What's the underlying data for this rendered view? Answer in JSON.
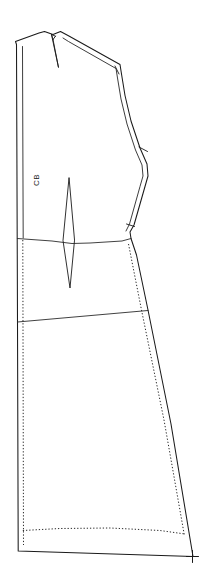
{
  "drawing": {
    "title": "Back bodice and skirt pattern piece",
    "type": "sewing-pattern-technical-drawing",
    "canvas": {
      "width": 204,
      "height": 585,
      "background": "#ffffff"
    },
    "colors": {
      "cutting_line": "#1a1a1a",
      "seam_line": "#1a1a1a",
      "stitch_line": "#2b2b2b",
      "background": "#ffffff"
    }
  },
  "labels": {
    "center_back": "CB",
    "center_back_position": {
      "x": 32,
      "y": 186
    }
  },
  "pattern": {
    "piece_name": "CB",
    "cutting_line_path": "M 15.5 41.5 L 16.5 44.5 L 17.2 238.0 L 17.5 322.0 L 18.2 551.0 L 193.0 556.5 L 171.0 424.0 L 148.0 310.0 L 136.5 255.0 L 131.0 238.5 L 130.0 232.0 L 134.0 225.0 L 145.0 186.5 L 148.0 176.0 L 147.0 164.0 L 140.0 148.0 L 131.0 121.0 L 125.0 95.5 L 121.5 74.0 L 120.0 64.5 L 68.0 35.5 L 60.5 31.5 L 53.0 34.5 L 44.5 31.5 L 39.0 33.0 L 15.5 41.5 Z",
    "seam_allowance_path": "M 22.5 46.5 L 23.2 238.0 M 63.0 38.0 L 68.5 41.5 L 116.0 68.5 L 117.5 78.0 L 121.0 99.0 L 127.0 124.0 L 135.5 150.0 L 142.0 165.0 L 143.0 176.0 L 140.0 186.5 L 129.5 224.0 L 126.0 231.0",
    "internal_lines": [
      {
        "name": "waistline",
        "path": "M 17.3 238.5 L 52.0 241.0 L 72.0 243.5 L 90.0 243.0 L 122.0 241.0 L 131.0 238.5"
      },
      {
        "name": "hipline",
        "path": "M 17.5 322.0 L 148.0 310.5"
      }
    ],
    "darts": [
      {
        "name": "shoulder-dart",
        "path": "M 51.5 34.5 L 58.5 67.5 L 53.0 39.5 M 51.5 34.5 L 53.0 39.5 M 55.5 36.2 L 53.0 39.5 M 51.5 34.5 L 55.5 36.2"
      },
      {
        "name": "waist-dart",
        "path": "M 69.0 178.0 L 63.0 240.5 L 70.0 288.0 L 74.5 240.5 Z"
      }
    ],
    "stitch_lines": [
      {
        "name": "center-back-stitch-line",
        "path": "M 22.8 240.0 L 23.5 545.0"
      },
      {
        "name": "side-seam-stitch-line",
        "path": "M 128.5 244.0 L 141.5 310.0 L 164.0 420.0 L 184.5 536.0"
      },
      {
        "name": "hem-stitch-line",
        "path": "M 22.8 530.5 L 60.0 528.5 L 110.0 528.0 L 160.0 530.5 L 185.0 534.0"
      }
    ],
    "notches": [
      {
        "name": "shoulder-notch",
        "path": "M 115.0 66.0 L 119.0 74.0"
      },
      {
        "name": "armhole-notch",
        "path": "M 139.0 147.0 L 147.5 151.5"
      },
      {
        "name": "side-seam-notch",
        "path": "M 126.5 224.0 L 134.5 226.5"
      }
    ],
    "marks": [
      {
        "name": "hem-corner-cross",
        "path": "M 186.5 556.5 L 198.5 556.5 M 192.5 550.5 L 192.5 562.5"
      }
    ]
  }
}
